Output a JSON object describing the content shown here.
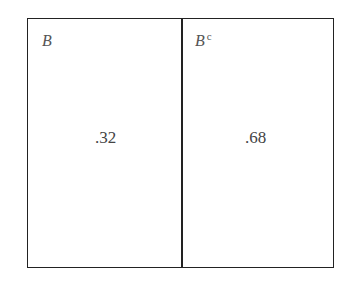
{
  "diagram": {
    "type": "partition-box",
    "regions": [
      {
        "label": "B",
        "superscript": "",
        "value": ".32"
      },
      {
        "label": "B",
        "superscript": "c",
        "value": ".68"
      }
    ]
  }
}
